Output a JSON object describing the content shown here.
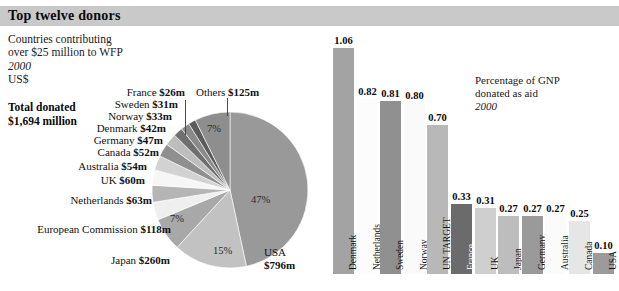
{
  "header": {
    "title": "Top twelve donors",
    "bar_color": "#c9c9c9"
  },
  "intro": {
    "line1": "Countries contributing",
    "line2": "over $25 million to WFP",
    "year": "2000",
    "currency": "US$",
    "total_label": "Total donated",
    "total_value": "$1,694 million"
  },
  "gnp_note": {
    "line1": "Percentage of GNP",
    "line2": "donated as aid",
    "year": "2000"
  },
  "chart_data": [
    {
      "type": "pie",
      "title": "Top twelve donors",
      "subtitle": "Countries contributing over $25 million to WFP, 2000, US$",
      "total": "$1,694 million",
      "value_unit": "US$ millions",
      "labels": [
        "USA",
        "Japan",
        "European Commission",
        "Netherlands",
        "UK",
        "Australia",
        "Canada",
        "Germany",
        "Denmark",
        "Norway",
        "Sweden",
        "France",
        "Others"
      ],
      "values": [
        796,
        260,
        118,
        63,
        60,
        54,
        52,
        47,
        42,
        33,
        31,
        26,
        125
      ],
      "value_labels": [
        "USA $796m",
        "Japan $260m",
        "European Commission $118m",
        "Netherlands $63m",
        "UK $60m",
        "Australia $54m",
        "Canada $52m",
        "Germany $47m",
        "Denmark $42m",
        "Norway $33m",
        "Sweden $31m",
        "France $26m",
        "Others $125m"
      ],
      "pct_annotations": [
        "47%",
        "15%",
        "7%",
        "7%"
      ],
      "pct_annotation_for": [
        "USA",
        "Japan",
        "European Commission",
        "Others"
      ],
      "colors": [
        "#999999",
        "#c2c2c2",
        "#a8a8a8",
        "#efefef",
        "#b5b5b5",
        "#f6f6f6",
        "#d2d2d2",
        "#8f8f8f",
        "#bdbdbd",
        "#6f6f6f",
        "#8a8a8a",
        "#5c5c5c",
        "#8e8e8e"
      ],
      "legend": "none",
      "grid": false
    },
    {
      "type": "bar",
      "title": "Percentage of GNP donated as aid",
      "subtitle": "2000",
      "xlabel": "",
      "ylabel": "Percentage of GNP",
      "ylim": [
        0,
        1.06
      ],
      "grid": false,
      "legend": "none",
      "categories": [
        "Denmark",
        "Netherlands",
        "Sweden",
        "Norway",
        "UN TARGET",
        "France",
        "UK",
        "Japan",
        "Germany",
        "Australia",
        "Canada",
        "USA"
      ],
      "values": [
        1.06,
        0.82,
        0.81,
        0.8,
        0.7,
        0.33,
        0.31,
        0.27,
        0.27,
        0.27,
        0.25,
        0.1
      ],
      "value_labels": [
        "1.06",
        "0.82",
        "0.81",
        "0.80",
        "0.70",
        "0.33",
        "0.31",
        "0.27",
        "0.27",
        "0.27",
        "0.25",
        "0.10"
      ],
      "colors": [
        "#a3a3a3",
        "#fcfcfc",
        "#909090",
        "#fafafa",
        "#b8b8b8",
        "#6b6b6b",
        "#cfcfcf",
        "#bdbdbd",
        "#9a9a9a",
        "#fbfbfb",
        "#e6e6e6",
        "#9b9b9b"
      ]
    }
  ],
  "pie": {
    "labels": [
      {
        "id": "others",
        "text_plain": "Others ",
        "text_bold": "$125m"
      },
      {
        "id": "france",
        "text_plain": "France ",
        "text_bold": "$26m"
      },
      {
        "id": "sweden",
        "text_plain": "Sweden ",
        "text_bold": "$31m"
      },
      {
        "id": "norway",
        "text_plain": "Norway ",
        "text_bold": "$33m"
      },
      {
        "id": "denmark",
        "text_plain": "Denmark ",
        "text_bold": "$42m"
      },
      {
        "id": "germany",
        "text_plain": "Germany ",
        "text_bold": "$47m"
      },
      {
        "id": "canada",
        "text_plain": "Canada ",
        "text_bold": "$52m"
      },
      {
        "id": "australia",
        "text_plain": "Australia ",
        "text_bold": "$54m"
      },
      {
        "id": "uk",
        "text_plain": "UK ",
        "text_bold": "$60m"
      },
      {
        "id": "netherlands",
        "text_plain": "Netherlands ",
        "text_bold": "$63m"
      },
      {
        "id": "ec",
        "text_plain": "European Commission ",
        "text_bold": "$118m"
      },
      {
        "id": "japan",
        "text_plain": "Japan ",
        "text_bold": "$260m"
      },
      {
        "id": "usa",
        "text_plain": "USA",
        "text_bold": "$796m"
      }
    ],
    "pct": {
      "usa": "47%",
      "japan": "15%",
      "ec": "7%",
      "others": "7%"
    }
  },
  "bars": {
    "items": [
      {
        "name": "Denmark",
        "value_label": "1.06",
        "label_light": false
      },
      {
        "name": "Netherlands",
        "value_label": "0.82",
        "label_light": false
      },
      {
        "name": "Sweden",
        "value_label": "0.81",
        "label_light": false
      },
      {
        "name": "Norway",
        "value_label": "0.80",
        "label_light": false
      },
      {
        "name": "UN TARGET",
        "value_label": "0.70",
        "label_light": false
      },
      {
        "name": "France",
        "value_label": "0.33",
        "label_light": true
      },
      {
        "name": "UK",
        "value_label": "0.31",
        "label_light": false
      },
      {
        "name": "Japan",
        "value_label": "0.27",
        "label_light": false
      },
      {
        "name": "Germany",
        "value_label": "0.27",
        "label_light": false
      },
      {
        "name": "Australia",
        "value_label": "0.27",
        "label_light": false
      },
      {
        "name": "Canada",
        "value_label": "0.25",
        "label_light": false
      },
      {
        "name": "USA",
        "value_label": "0.10",
        "label_light": false
      }
    ]
  }
}
